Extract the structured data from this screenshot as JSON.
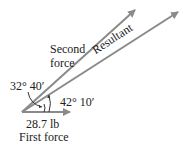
{
  "diagram": {
    "title": "",
    "vectors": [
      {
        "name": "First force",
        "magnitude_label": "28.7 lb",
        "color": "#8a8a8a"
      },
      {
        "name": "Second force",
        "label_line1": "Second",
        "label_line2": "force",
        "color": "#8a8a8a"
      },
      {
        "name": "Resultant",
        "label": "Resultant",
        "color": "#8a8a8a"
      }
    ],
    "angles": {
      "between_first_and_second": "32° 40′",
      "between_first_and_resultant": "42° 10′"
    },
    "labels": {
      "first_force_magnitude": "28.7 lb",
      "first_force_name": "First force",
      "second_force_line1": "Second",
      "second_force_line2": "force",
      "resultant": "Resultant",
      "angle_upper": "32° 40′",
      "angle_lower": "42° 10′"
    }
  }
}
